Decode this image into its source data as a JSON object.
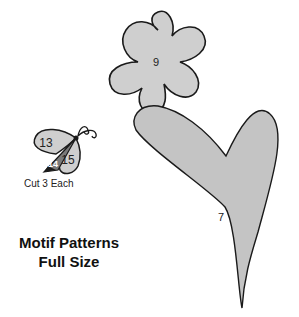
{
  "pieces": {
    "flower": {
      "number": "9"
    },
    "heart": {
      "number": "7"
    },
    "butterfly": {
      "wing_top": "13",
      "body": "14",
      "wing_bottom": "15"
    }
  },
  "caption": "Cut 3 Each",
  "title": {
    "line1": "Motif Patterns",
    "line2": "Full Size"
  },
  "colors": {
    "fill": "#cfcfcf",
    "stroke": "#1a1a1a",
    "dark_fill": "#7a7a7a"
  }
}
